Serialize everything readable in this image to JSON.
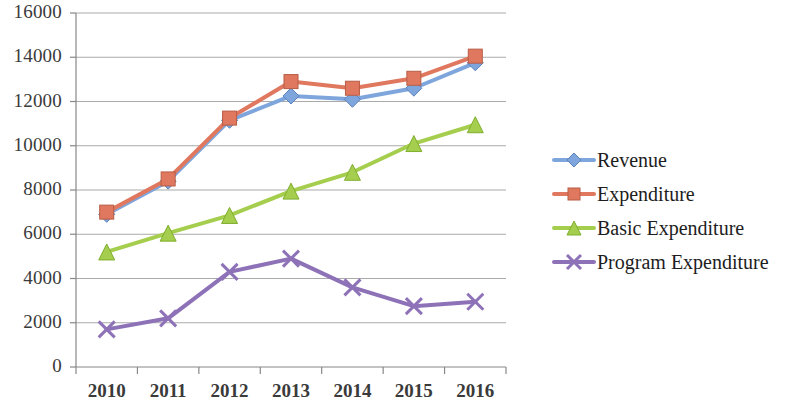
{
  "chart_data": {
    "type": "line",
    "title": "",
    "xlabel": "",
    "ylabel": "",
    "categories": [
      "2010",
      "2011",
      "2012",
      "2013",
      "2014",
      "2015",
      "2016"
    ],
    "ylim": [
      0,
      16000
    ],
    "ytick_labels": [
      "0",
      "2000",
      "4000",
      "6000",
      "8000",
      "10000",
      "12000",
      "14000",
      "16000"
    ],
    "ytick_values": [
      0,
      2000,
      4000,
      6000,
      8000,
      10000,
      12000,
      14000,
      16000
    ],
    "grid": true,
    "legend_position": "right",
    "series": [
      {
        "name": "Revenue",
        "color": "#7FA6DC",
        "marker": "diamond",
        "values": [
          6900,
          8400,
          11150,
          12250,
          12100,
          12600,
          13750
        ]
      },
      {
        "name": "Expenditure",
        "color": "#E0785F",
        "marker": "square",
        "values": [
          7000,
          8500,
          11250,
          12900,
          12600,
          13050,
          14050
        ]
      },
      {
        "name": "Basic Expenditure",
        "color": "#A5CE4E",
        "marker": "triangle",
        "values": [
          5200,
          6050,
          6850,
          7950,
          8800,
          10100,
          10950
        ]
      },
      {
        "name": "Program Expenditure",
        "color": "#8E72B8",
        "marker": "cross",
        "values": [
          1700,
          2200,
          4300,
          4900,
          3600,
          2750,
          2950
        ]
      }
    ]
  },
  "legend": {
    "items": [
      {
        "label": "Revenue"
      },
      {
        "label": "Expenditure"
      },
      {
        "label": "Basic Expenditure"
      },
      {
        "label": "Program Expenditure"
      }
    ]
  }
}
